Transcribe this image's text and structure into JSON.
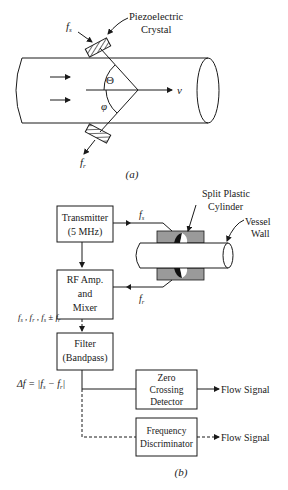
{
  "part_a": {
    "crystal_label_line1": "Piezoelectric",
    "crystal_label_line2": "Crystal",
    "fs": "f",
    "fs_sub": "s",
    "fr": "f",
    "fr_sub": "r",
    "theta": "Θ",
    "phi": "φ",
    "velocity": "v",
    "caption": "(a)"
  },
  "part_b": {
    "transmitter_line1": "Transmitter",
    "transmitter_line2": "(5 MHz)",
    "rf_line1": "RF Amp.",
    "rf_line2": "and",
    "rf_line3": "Mixer",
    "mixer_output": "fs , fr , fs ± fr",
    "filter_line1": "Filter",
    "filter_line2": "(Bandpass)",
    "delta_f": "Δf =  |fs − fr|",
    "zcd_line1": "Zero",
    "zcd_line2": "Crossing",
    "zcd_line3": "Detector",
    "fd_line1": "Frequency",
    "fd_line2": "Discriminator",
    "flow_signal_1": "Flow Signal",
    "flow_signal_2": "Flow Signal",
    "split_label_line1": "Split Plastic",
    "split_label_line2": "Cylinder",
    "vessel_label_line1": "Vessel",
    "vessel_label_line2": "Wall",
    "fs": "f",
    "fs_sub": "s",
    "fr": "f",
    "fr_sub": "r",
    "caption": "(b)"
  }
}
